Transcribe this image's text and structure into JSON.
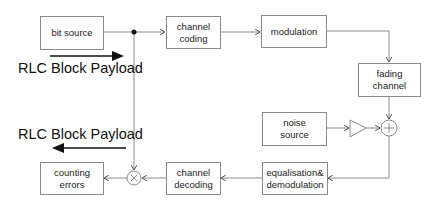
{
  "diagram": {
    "blocks": {
      "bit_source": "bit source",
      "channel_coding_1": "channel",
      "channel_coding_2": "coding",
      "modulation": "modulation",
      "fading_channel_1": "fading",
      "fading_channel_2": "channel",
      "noise_source_1": "noise",
      "noise_source_2": "source",
      "equalisation_1": "equalisation&",
      "equalisation_2": "demodulation",
      "channel_decoding_1": "channel",
      "channel_decoding_2": "decoding",
      "counting_errors_1": "counting",
      "counting_errors_2": "errors"
    },
    "labels": {
      "rlc_top": "RLC Block Payload",
      "rlc_bottom": "RLC Block Payload"
    },
    "symbols": {
      "adder": "plus-circle",
      "multiplier": "times-circle",
      "amplifier": "triangle"
    },
    "flow": [
      "bit source -> channel coding",
      "channel coding -> modulation",
      "modulation -> fading channel",
      "fading channel -> adder",
      "noise source -> amplifier -> adder",
      "adder -> equalisation& demodulation",
      "equalisation& demodulation -> channel decoding",
      "channel decoding -> multiplier",
      "bit source (tap) -> multiplier",
      "multiplier -> counting errors"
    ],
    "colors": {
      "line": "#8a8a8a",
      "text": "#222222",
      "arrow_bold": "#111111"
    }
  }
}
